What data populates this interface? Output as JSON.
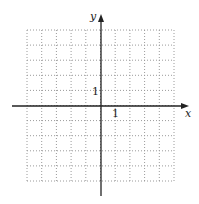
{
  "diagram": {
    "type": "coordinate-grid",
    "grid": {
      "columns": 10,
      "rows": 10,
      "left": 27,
      "top": 30,
      "right": 174,
      "bottom": 181,
      "line_style": "dotted",
      "line_color": "#9a9a9a"
    },
    "axes": {
      "x_label": "x",
      "y_label": "y",
      "color": "#222222",
      "origin_col": 5,
      "origin_row": 5
    },
    "ticks": {
      "x_unit_label": "1",
      "y_unit_label": "1"
    }
  }
}
